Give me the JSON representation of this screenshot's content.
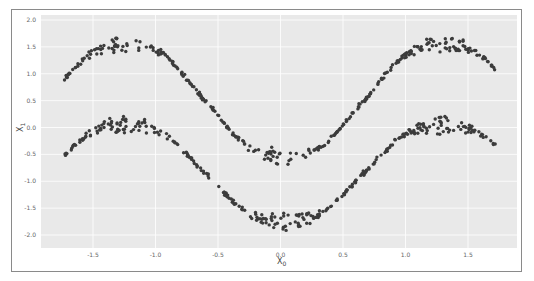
{
  "chart_data": {
    "type": "scatter",
    "title": "",
    "xlabel": "X",
    "xlabel_sub": "0",
    "ylabel": "X",
    "ylabel_sub": "1",
    "xlim": [
      -1.86,
      1.95
    ],
    "ylim": [
      -2.25,
      2.1
    ],
    "x_ticks": [
      -1.5,
      -1.0,
      -0.5,
      0.0,
      0.5,
      1.0,
      1.5
    ],
    "x_tick_labels": [
      "-1.5",
      "-1.0",
      "-0.5",
      "0.0",
      "0.5",
      "1.0",
      "1.5"
    ],
    "y_ticks": [
      2.0,
      1.5,
      1.0,
      0.5,
      0.0,
      -0.5,
      -1.0,
      -1.5,
      -2.0
    ],
    "y_tick_labels": [
      "2.0",
      "1.5",
      "1.0",
      "0.5",
      "0.0",
      "-0.5",
      "-1.0",
      "-1.5",
      "-2.0"
    ],
    "grid": true,
    "legend": null,
    "background": "#e9e9e9",
    "marker_color": "#3c3c3c",
    "series": [
      {
        "name": "upper band",
        "description": "sinusoidal band, noise grows near extrema",
        "x_range": [
          -1.73,
          1.72
        ],
        "points": [
          [
            -1.73,
            0.45
          ],
          [
            -1.5,
            1.1
          ],
          [
            -1.2,
            1.65
          ],
          [
            -0.9,
            1.3
          ],
          [
            -0.6,
            0.4
          ],
          [
            -0.3,
            -0.4
          ],
          [
            0.0,
            -0.7
          ],
          [
            0.3,
            -0.3
          ],
          [
            0.6,
            0.7
          ],
          [
            0.9,
            1.5
          ],
          [
            1.0,
            1.65
          ],
          [
            1.2,
            1.45
          ],
          [
            1.5,
            0.6
          ],
          [
            1.72,
            -0.1
          ]
        ],
        "model": {
          "amp": 1.2,
          "freq": 2.48,
          "phase": -1.65,
          "offset": 0.5
        }
      },
      {
        "name": "lower band",
        "description": "same shape shifted down",
        "x_range": [
          -1.73,
          1.72
        ],
        "points": [
          [
            -1.73,
            -0.85
          ],
          [
            -1.5,
            -0.3
          ],
          [
            -1.2,
            0.15
          ],
          [
            -0.9,
            -0.2
          ],
          [
            -0.6,
            -1.0
          ],
          [
            -0.3,
            -1.6
          ],
          [
            0.0,
            -1.9
          ],
          [
            0.3,
            -1.5
          ],
          [
            0.6,
            -0.7
          ],
          [
            0.9,
            -0.05
          ],
          [
            1.0,
            0.1
          ],
          [
            1.2,
            -0.1
          ],
          [
            1.5,
            -0.8
          ],
          [
            1.72,
            -1.45
          ]
        ],
        "model": {
          "amp": 1.05,
          "freq": 2.48,
          "phase": -1.65,
          "offset": -0.85
        }
      }
    ]
  }
}
